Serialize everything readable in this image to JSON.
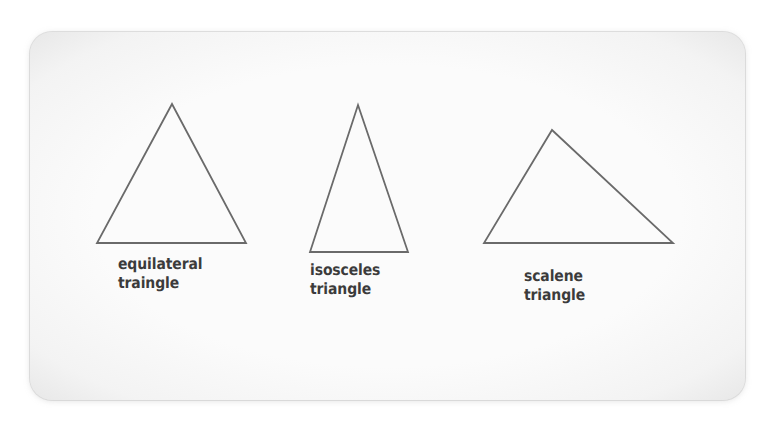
{
  "figure": {
    "card": {
      "background_color": "#fbfbfb",
      "border_color": "#c8c8c8",
      "corner_radius_px": 22
    },
    "stroke_color": "#6a6a6a",
    "stroke_width_px": 1.8,
    "label_color": "#3b3b3b",
    "shapes": [
      {
        "id": "equilateral",
        "kind": "triangle",
        "label_lines": [
          "equilateral",
          "traingle"
        ],
        "apex": {
          "x": 172,
          "y": 104
        },
        "base_left": {
          "x": 97,
          "y": 243
        },
        "base_right": {
          "x": 246,
          "y": 243
        }
      },
      {
        "id": "isosceles",
        "kind": "triangle",
        "label_lines": [
          "isosceles",
          "triangle"
        ],
        "apex": {
          "x": 358,
          "y": 105
        },
        "base_left": {
          "x": 310,
          "y": 252
        },
        "base_right": {
          "x": 408,
          "y": 252
        }
      },
      {
        "id": "scalene",
        "kind": "triangle",
        "label_lines": [
          "scalene",
          "triangle"
        ],
        "apex": {
          "x": 552,
          "y": 130
        },
        "base_left": {
          "x": 484,
          "y": 243
        },
        "base_right": {
          "x": 673,
          "y": 243
        }
      }
    ]
  }
}
